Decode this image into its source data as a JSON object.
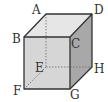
{
  "diagram": {
    "type": "cube",
    "vertices": {
      "A": {
        "label": "A",
        "x": 46,
        "y": 14
      },
      "D": {
        "label": "D",
        "x": 92,
        "y": 14
      },
      "B": {
        "label": "B",
        "x": 24,
        "y": 37
      },
      "C": {
        "label": "C",
        "x": 70,
        "y": 37
      },
      "E": {
        "label": "E",
        "x": 46,
        "y": 67
      },
      "H": {
        "label": "H",
        "x": 92,
        "y": 67
      },
      "F": {
        "label": "F",
        "x": 24,
        "y": 89
      },
      "G": {
        "label": "G",
        "x": 70,
        "y": 89
      }
    },
    "hidden_edges": [
      "AE",
      "EF",
      "EH"
    ],
    "colors": {
      "front_face": "#d6d6d6",
      "top_face": "#e6e6e6",
      "right_face": "#a8a8a8",
      "edge": "#333333",
      "hidden_edge": "#777777"
    }
  }
}
